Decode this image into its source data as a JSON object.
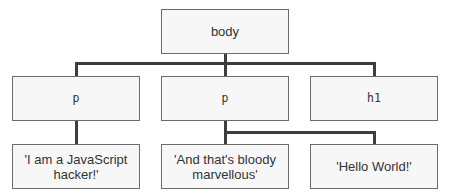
{
  "diagram": {
    "type": "dom-tree",
    "nodes": {
      "root": {
        "label": "body",
        "kind": "element"
      },
      "child1": {
        "label": "p",
        "kind": "element",
        "parent": "body"
      },
      "child2": {
        "label": "p",
        "kind": "element",
        "parent": "body"
      },
      "child3": {
        "label": "h1",
        "kind": "element",
        "parent": "body"
      },
      "text1": {
        "label": "'I am a JavaScript hacker!'",
        "kind": "text",
        "parent": "p (1st)"
      },
      "text2": {
        "label": "'And that's bloody marvellous'",
        "kind": "text",
        "parent": "p (2nd)"
      },
      "text3": {
        "label": "'Hello World!'",
        "kind": "text",
        "parent": "p (2nd)"
      }
    },
    "edges": [
      [
        "body",
        "p (1st)"
      ],
      [
        "body",
        "p (2nd)"
      ],
      [
        "body",
        "h1"
      ],
      [
        "p (1st)",
        "'I am a JavaScript hacker!'"
      ],
      [
        "p (2nd)",
        "'And that's bloody marvellous'"
      ],
      [
        "p (2nd)",
        "'Hello World!'"
      ]
    ],
    "colors": {
      "node_fill": "#f7f7f7",
      "node_border": "#6b6b6b",
      "connector": "#3d3d3d",
      "text": "#333333"
    }
  }
}
